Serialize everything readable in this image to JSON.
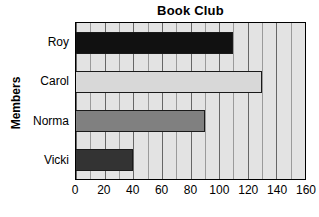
{
  "chart_data": {
    "type": "bar",
    "orientation": "horizontal",
    "title": "Book Club",
    "xlabel": "",
    "ylabel": "Members",
    "categories": [
      "Roy",
      "Carol",
      "Norma",
      "Vicki"
    ],
    "values": [
      110,
      130,
      90,
      40
    ],
    "xlim": [
      0,
      160
    ],
    "xticks": [
      0,
      20,
      40,
      60,
      80,
      100,
      120,
      140,
      160
    ],
    "xtick_labels": [
      "0",
      "20",
      "40",
      "60",
      "80",
      "100",
      "120",
      "140",
      "160"
    ],
    "minor_tick_step": 10,
    "grid": true,
    "grid_axis": "x",
    "legend": false,
    "bar_colors": [
      "#111111",
      "#d8d8d8",
      "#808080",
      "#333333"
    ],
    "bar_border_color": "#1a1a1a",
    "plot_background": "#e3e3e3",
    "gridline_color": "#666666",
    "minor_gridline_color": "#9a9a9a",
    "series": [
      {
        "name": "Books read",
        "points": [
          {
            "category": "Roy",
            "value": 110,
            "color": "#111111"
          },
          {
            "category": "Carol",
            "value": 130,
            "color": "#d8d8d8"
          },
          {
            "category": "Norma",
            "value": 90,
            "color": "#808080"
          },
          {
            "category": "Vicki",
            "value": 40,
            "color": "#333333"
          }
        ]
      }
    ]
  }
}
